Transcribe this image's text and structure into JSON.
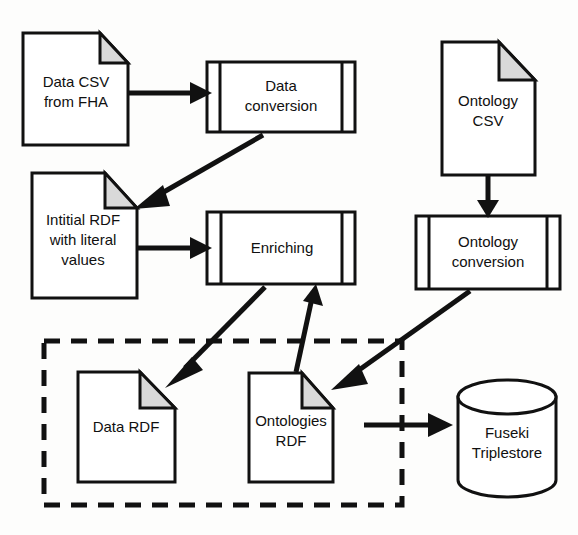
{
  "diagram": {
    "colors": {
      "stroke": "#111111",
      "fill": "#ffffff",
      "fold": "#d9d9d9",
      "background": "#fdfdfc"
    },
    "nodes": [
      {
        "id": "data-csv",
        "shape": "document",
        "label_line1": "Data CSV",
        "label_line2": "from FHA"
      },
      {
        "id": "data-conversion",
        "shape": "predefined-process",
        "label_line1": "Data",
        "label_line2": "conversion"
      },
      {
        "id": "initial-rdf",
        "shape": "document",
        "label_line1": "Intitial RDF",
        "label_line2": "with literal",
        "label_line3": "values"
      },
      {
        "id": "enriching",
        "shape": "predefined-process",
        "label_line1": "Enriching",
        "label_line2": ""
      },
      {
        "id": "ontology-csv",
        "shape": "document",
        "label_line1": "Ontology",
        "label_line2": "CSV"
      },
      {
        "id": "ontology-conversion",
        "shape": "predefined-process",
        "label_line1": "Ontology",
        "label_line2": "conversion"
      },
      {
        "id": "data-rdf",
        "shape": "document",
        "label_line1": "Data RDF",
        "label_line2": ""
      },
      {
        "id": "ontologies-rdf",
        "shape": "document",
        "label_line1": "Ontologies",
        "label_line2": "RDF"
      },
      {
        "id": "fuseki",
        "shape": "cylinder",
        "label_line1": "Fuseki",
        "label_line2": "Triplestore"
      }
    ],
    "group": {
      "id": "rdf-store-group",
      "style": "dashed",
      "label": ""
    },
    "edges": [
      {
        "from": "data-csv",
        "to": "data-conversion",
        "label": ""
      },
      {
        "from": "data-conversion",
        "to": "initial-rdf",
        "label": ""
      },
      {
        "from": "initial-rdf",
        "to": "enriching",
        "label": ""
      },
      {
        "from": "enriching",
        "to": "data-rdf",
        "label": ""
      },
      {
        "from": "ontologies-rdf",
        "to": "enriching",
        "label": ""
      },
      {
        "from": "ontology-csv",
        "to": "ontology-conversion",
        "label": ""
      },
      {
        "from": "ontology-conversion",
        "to": "ontologies-rdf",
        "label": ""
      },
      {
        "from": "ontologies-rdf",
        "to": "fuseki",
        "label": ""
      }
    ]
  }
}
